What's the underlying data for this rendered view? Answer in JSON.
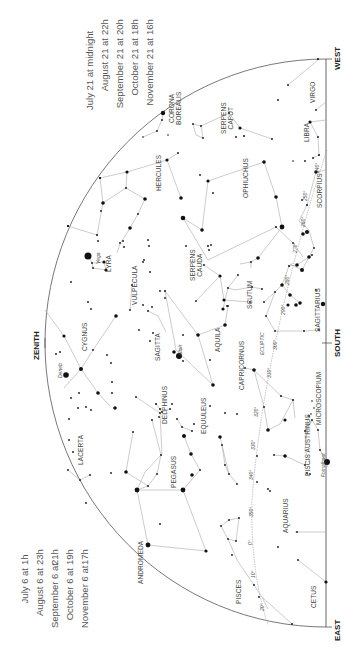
{
  "timetable_left": {
    "rows": [
      {
        "date": "July 6 at",
        "time": "1h"
      },
      {
        "date": "August 6 at",
        "time": "23h"
      },
      {
        "date": "September 6 at",
        "time": "21h"
      },
      {
        "date": "October 6 at",
        "time": "19h"
      },
      {
        "date": "November 6 at",
        "time": "17h"
      }
    ]
  },
  "timetable_right": {
    "rows": [
      {
        "date": "July 21 at midnight",
        "time": ""
      },
      {
        "date": "August 21 at",
        "time": "22h"
      },
      {
        "date": "September 21 at",
        "time": "20h"
      },
      {
        "date": "October 21 at",
        "time": "18h"
      },
      {
        "date": "November 21 at",
        "time": "16h"
      }
    ]
  },
  "directions": {
    "west": "WEST",
    "south": "SOUTH",
    "east": "EAST",
    "zenith": "ZENITH"
  },
  "constellations": [
    {
      "name": "VIRGO",
      "x": 312,
      "y": 92
    },
    {
      "name": "CORONA\nBOREALIS",
      "x": 175,
      "y": 108
    },
    {
      "name": "SERPENS\nCAPUT",
      "x": 227,
      "y": 118
    },
    {
      "name": "LIBRA",
      "x": 306,
      "y": 132
    },
    {
      "name": "HERCULES",
      "x": 158,
      "y": 173
    },
    {
      "name": "OPHIUCHUS",
      "x": 245,
      "y": 178
    },
    {
      "name": "SCORPIUS",
      "x": 319,
      "y": 190
    },
    {
      "name": "LYRA",
      "x": 108,
      "y": 263
    },
    {
      "name": "SERPENS\nCAUDA",
      "x": 196,
      "y": 265
    },
    {
      "name": "VULPECULA",
      "x": 134,
      "y": 285
    },
    {
      "name": "SCUTUM",
      "x": 249,
      "y": 295
    },
    {
      "name": "SAGITTARIUS",
      "x": 317,
      "y": 310
    },
    {
      "name": "CYGNUS",
      "x": 84,
      "y": 337
    },
    {
      "name": "SAGITTA",
      "x": 157,
      "y": 347
    },
    {
      "name": "AQUILA",
      "x": 217,
      "y": 340
    },
    {
      "name": "CAPRICORNUS",
      "x": 241,
      "y": 365
    },
    {
      "name": "MICROSCOPIUM",
      "x": 318,
      "y": 398
    },
    {
      "name": "DELPHINUS",
      "x": 164,
      "y": 405
    },
    {
      "name": "EQUULEUS",
      "x": 203,
      "y": 415
    },
    {
      "name": "LACERTA",
      "x": 80,
      "y": 450
    },
    {
      "name": "PISCIS AUSTRINUS",
      "x": 307,
      "y": 445
    },
    {
      "name": "PEGASUS",
      "x": 173,
      "y": 472
    },
    {
      "name": "AQUARIUS",
      "x": 285,
      "y": 515
    },
    {
      "name": "ANDROMEDA",
      "x": 140,
      "y": 562
    },
    {
      "name": "PISCES",
      "x": 238,
      "y": 592
    },
    {
      "name": "CETUS",
      "x": 313,
      "y": 596
    }
  ],
  "named_stars": [
    {
      "name": "Vega",
      "x": 98,
      "y": 258
    },
    {
      "name": "Deneb",
      "x": 60,
      "y": 370
    },
    {
      "name": "Altair",
      "x": 180,
      "y": 350
    },
    {
      "name": "Fomalhaut",
      "x": 323,
      "y": 465
    }
  ],
  "ecliptic": {
    "label": "ECLIPTIC",
    "label_x": 265,
    "label_y": 340,
    "degrees": [
      {
        "label": "240°",
        "x": 317,
        "y": 168
      },
      {
        "label": "250°",
        "x": 305,
        "y": 196
      },
      {
        "label": "260°",
        "x": 303,
        "y": 222
      },
      {
        "label": "270°",
        "x": 295,
        "y": 248
      },
      {
        "label": "280°",
        "x": 287,
        "y": 280
      },
      {
        "label": "290°",
        "x": 283,
        "y": 310
      },
      {
        "label": "300°",
        "x": 275,
        "y": 345
      },
      {
        "label": "310°",
        "x": 269,
        "y": 373
      },
      {
        "label": "320°",
        "x": 256,
        "y": 412
      },
      {
        "label": "330°",
        "x": 253,
        "y": 445
      },
      {
        "label": "340°",
        "x": 251,
        "y": 475
      },
      {
        "label": "350°",
        "x": 251,
        "y": 512
      },
      {
        "label": "0°",
        "x": 250,
        "y": 542
      },
      {
        "label": "10°",
        "x": 253,
        "y": 574
      },
      {
        "label": "20°",
        "x": 262,
        "y": 607
      }
    ]
  }
}
